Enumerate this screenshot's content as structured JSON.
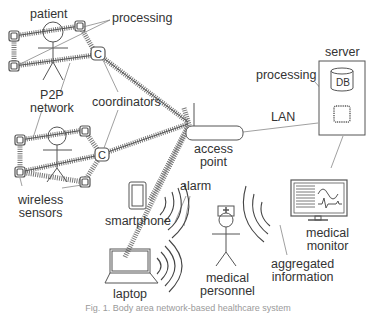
{
  "labels": {
    "patient": "patient",
    "processing_top": "processing",
    "p2p_line1": "P2P",
    "p2p_line2": "network",
    "coordinators": "coordinators",
    "wireless_line1": "wireless",
    "wireless_line2": "sensors",
    "server": "server",
    "processing_server": "processing",
    "db": "DB",
    "lan": "LAN",
    "access_line1": "access",
    "access_line2": "point",
    "smartphone": "smartphone",
    "alarm": "alarm",
    "laptop": "laptop",
    "medical_personnel_line1": "medical",
    "medical_personnel_line2": "personnel",
    "aggregated_line1": "aggregated",
    "aggregated_line2": "information",
    "medical_monitor_line1": "medical",
    "medical_monitor_line2": "monitor",
    "coordinator_glyph": "C"
  },
  "caption": "Fig. 1. Body area network-based healthcare system",
  "colors": {
    "stroke": "#555555",
    "text": "#333333",
    "background": "#ffffff"
  },
  "icons": [
    "person-icon",
    "sensor-node-icon",
    "coordinator-icon",
    "access-point-icon",
    "server-icon",
    "database-icon",
    "processor-chip-icon",
    "smartphone-icon",
    "laptop-icon",
    "medical-monitor-icon",
    "medical-personnel-icon",
    "wireless-signal-icon"
  ]
}
